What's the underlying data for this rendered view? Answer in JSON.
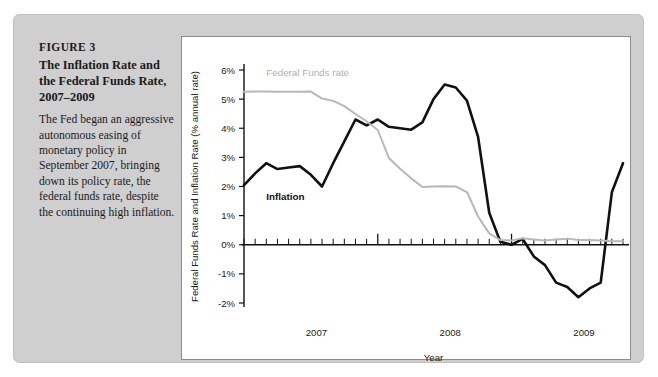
{
  "figure": {
    "number": "FIGURE 3",
    "title": "The Inflation Rate and the Federal Funds Rate, 2007–2009",
    "body": "The Fed began an aggressive autonomous easing of monetary policy in September 2007, bringing down its policy rate, the federal funds rate, despite the continuing high inflation."
  },
  "colors": {
    "card_background": "#cfcfcf",
    "panel_background": "#ffffff",
    "panel_border": "#8c8c8c",
    "inflation_line": "#111111",
    "federal_funds_line": "#b8b8b8",
    "axis": "#111111",
    "text": "#1a1a1a"
  },
  "chart_data": {
    "type": "line",
    "title": "",
    "xlabel": "Year",
    "ylabel": "Federal Funds Rate and Inflation Rate (% annual rate)",
    "ylim": [
      -2,
      6
    ],
    "yticks": [
      "-2%",
      "-1%",
      "0%",
      "1%",
      "2%",
      "3%",
      "4%",
      "5%",
      "6%"
    ],
    "ytick_values": [
      -2,
      -1,
      0,
      1,
      2,
      3,
      4,
      5,
      6
    ],
    "xlim": [
      "2007-01",
      "2009-11"
    ],
    "xticks": [
      "2007",
      "2008",
      "2009"
    ],
    "xtick_positions": [
      6.5,
      18.5,
      30.5
    ],
    "x_minor_ticks": "monthly",
    "grid": false,
    "legend_position": "inline-annotations",
    "x": [
      "2007-01",
      "2007-02",
      "2007-03",
      "2007-04",
      "2007-05",
      "2007-06",
      "2007-07",
      "2007-08",
      "2007-09",
      "2007-10",
      "2007-11",
      "2007-12",
      "2008-01",
      "2008-02",
      "2008-03",
      "2008-04",
      "2008-05",
      "2008-06",
      "2008-07",
      "2008-08",
      "2008-09",
      "2008-10",
      "2008-11",
      "2008-12",
      "2009-01",
      "2009-02",
      "2009-03",
      "2009-04",
      "2009-05",
      "2009-06",
      "2009-07",
      "2009-08",
      "2009-09",
      "2009-10",
      "2009-11"
    ],
    "series": [
      {
        "name": "Inflation",
        "label": "Inflation",
        "color": "#111111",
        "style": "solid-thick",
        "values": [
          2.05,
          2.45,
          2.8,
          2.6,
          2.65,
          2.7,
          2.4,
          2.0,
          2.8,
          3.55,
          4.3,
          4.1,
          4.3,
          4.05,
          4.0,
          3.95,
          4.2,
          5.0,
          5.5,
          5.4,
          4.95,
          3.7,
          1.1,
          0.1,
          0.0,
          0.2,
          -0.4,
          -0.7,
          -1.3,
          -1.45,
          -1.8,
          -1.5,
          -1.3,
          1.8,
          2.8
        ]
      },
      {
        "name": "Federal Funds rate",
        "label": "Federal Funds rate",
        "color": "#b8b8b8",
        "style": "solid-medium",
        "values": [
          5.25,
          5.26,
          5.26,
          5.25,
          5.25,
          5.25,
          5.26,
          5.02,
          4.94,
          4.76,
          4.49,
          4.24,
          3.94,
          2.98,
          2.61,
          2.28,
          1.98,
          2.0,
          2.01,
          2.0,
          1.81,
          0.97,
          0.39,
          0.16,
          0.15,
          0.22,
          0.18,
          0.15,
          0.18,
          0.21,
          0.16,
          0.16,
          0.15,
          0.12,
          0.12
        ]
      }
    ],
    "annotations": [
      {
        "text": "Federal Funds rate",
        "x": "2007-03",
        "y": 5.8
      },
      {
        "text": "Inflation",
        "x": "2007-03",
        "y": 1.55
      }
    ]
  }
}
